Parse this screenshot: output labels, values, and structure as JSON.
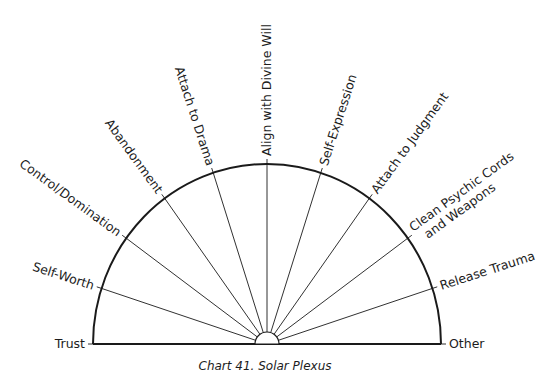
{
  "diagram": {
    "type": "semicircle-pendulum-chart",
    "caption": "Chart 41. Solar Plexus",
    "colors": {
      "stroke": "#1a1a1a",
      "text": "#1c1c1c",
      "background": "#ffffff"
    },
    "segments": [
      {
        "label": "Trust",
        "angle_deg": 180
      },
      {
        "label": "Self-Worth",
        "angle_deg": 162
      },
      {
        "label": "Control/Domination",
        "angle_deg": 144
      },
      {
        "label": "Abandonment",
        "angle_deg": 126
      },
      {
        "label": "Attach to Drama",
        "angle_deg": 108
      },
      {
        "label": "Align with Divine Will",
        "angle_deg": 90
      },
      {
        "label": "Self-Expression",
        "angle_deg": 72
      },
      {
        "label": "Attach to Judgment",
        "angle_deg": 54
      },
      {
        "label": [
          "Clean Psychic Cords",
          "and Weapons"
        ],
        "angle_deg": 36
      },
      {
        "label": "Release Trauma",
        "angle_deg": 18
      },
      {
        "label": "Other",
        "angle_deg": 0
      }
    ]
  }
}
